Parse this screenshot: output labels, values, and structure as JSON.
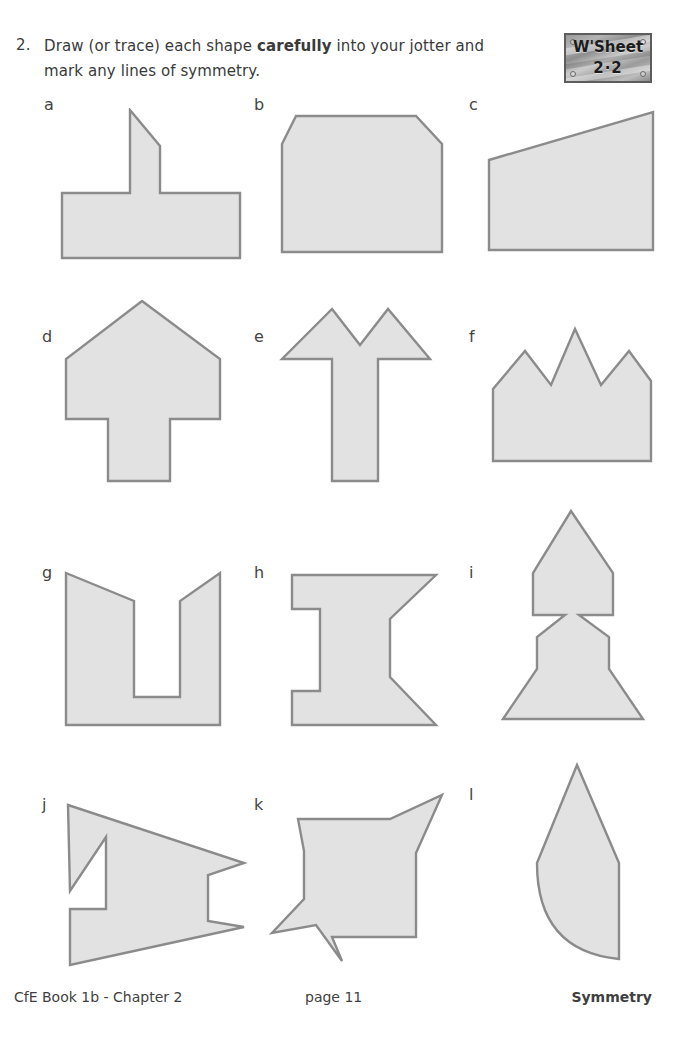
{
  "page": {
    "width": 680,
    "height": 1037,
    "background": "#ffffff",
    "shape_fill": "#e2e2e2",
    "shape_stroke": "#8b8b8b"
  },
  "header": {
    "question_number": "2.",
    "question_text_line1_a": "Draw (or trace) each shape ",
    "question_text_bold": "carefully",
    "question_text_line1_b": " into your jotter and",
    "question_text_line2": "mark any lines of symmetry."
  },
  "worksheet_badge": {
    "title": "W'Sheet",
    "code": "2·2"
  },
  "shapes": [
    {
      "label": "a",
      "name": "shape-a-steeple-tee",
      "description": "T-shape with pointed steeple roof",
      "points": "84,0 104,0 104,-0 84,0"
    },
    {
      "label": "b",
      "name": "shape-b-chamfered-rectangle",
      "description": "Rectangle with both top corners cut off"
    },
    {
      "label": "c",
      "name": "shape-c-right-trapezium",
      "description": "Right trapezium with sloping top edge"
    },
    {
      "label": "d",
      "name": "shape-d-thick-up-arrow",
      "description": "Thick upward arrow / house with stem"
    },
    {
      "label": "e",
      "name": "shape-e-double-peak-arrow",
      "description": "Double peaked arrow with vertical stem"
    },
    {
      "label": "f",
      "name": "shape-f-three-peak-crown",
      "description": "Crown with three peaks, centre tallest"
    },
    {
      "label": "g",
      "name": "shape-g-tapered-u",
      "description": "U shape with outward tapering prongs"
    },
    {
      "label": "h",
      "name": "shape-h-notched-i-beam",
      "description": "I-beam with stepped left notches and angled right notch"
    },
    {
      "label": "i",
      "name": "shape-i-rocket",
      "description": "Pointed top section pinched at waist above flaring base"
    },
    {
      "label": "j",
      "name": "shape-j-jagged-flag",
      "description": "Jagged flag / arrow with notches"
    },
    {
      "label": "k",
      "name": "shape-k-spiked-square",
      "description": "Square with spikes at top-right and bottom-left"
    },
    {
      "label": "l",
      "name": "shape-l-leaf",
      "description": "Leaf / petal with pointed top and curved left side"
    }
  ],
  "footer": {
    "book": "CfE Book 1b - Chapter 2",
    "page": "page 11",
    "topic": "Symmetry"
  }
}
